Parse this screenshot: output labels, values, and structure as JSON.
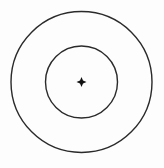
{
  "diagram": {
    "type": "concentric-circles",
    "background": "#fdfdfd",
    "stroke_color": "#2a2a2a",
    "center": {
      "x": 81.5,
      "y": 82
    },
    "outer_circle": {
      "r": 70.5,
      "stroke_width": 1.4
    },
    "inner_circle": {
      "r": 36,
      "stroke_width": 1.4
    },
    "center_mark": {
      "shape": "four-pointed-star",
      "size": 5,
      "color": "#111111"
    }
  }
}
